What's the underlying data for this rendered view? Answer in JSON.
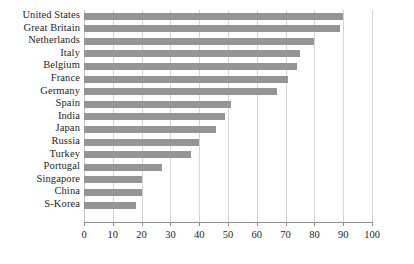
{
  "chart_data": {
    "type": "bar",
    "orientation": "horizontal",
    "title": "",
    "subtitle": "",
    "xlabel": "",
    "ylabel": "",
    "xlim": [
      0,
      100
    ],
    "xticks": [
      0,
      10,
      20,
      30,
      40,
      50,
      60,
      70,
      80,
      90,
      100
    ],
    "xtick_labels": [
      "0",
      "10",
      "20",
      "30",
      "40",
      "50",
      "60",
      "70",
      "80",
      "90",
      "100"
    ],
    "grid": "vertical",
    "legend": "none",
    "bar_color": "#959595",
    "gridline_color": "#d4d4d4",
    "axis_color": "#8f8f8f",
    "text_color": "#231f20",
    "categories": [
      "United States",
      "Great Britain",
      "Netherlands",
      "Italy",
      "Belgium",
      "France",
      "Germany",
      "Spain",
      "India",
      "Japan",
      "Russia",
      "Turkey",
      "Portugal",
      "Singapore",
      "China",
      "S-Korea"
    ],
    "values": [
      90,
      89,
      80,
      75,
      74,
      71,
      67,
      51,
      49,
      46,
      40,
      37,
      27,
      20,
      20,
      18
    ]
  }
}
